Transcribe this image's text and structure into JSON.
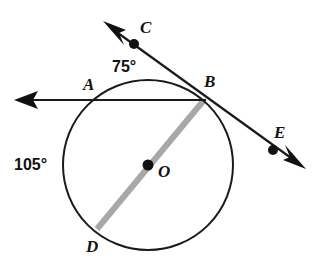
{
  "figure": {
    "type": "circle-geometry-diagram",
    "background_color": "#ffffff",
    "stroke_color": "#1a1a1a",
    "diameter_color": "#a8a8a8"
  },
  "circle": {
    "center_label": "O",
    "center_x": 148,
    "center_y": 165,
    "radius": 85
  },
  "points": [
    {
      "label": "A",
      "x": 93,
      "y": 100,
      "on_circle": true,
      "has_dot": false
    },
    {
      "label": "B",
      "x": 203,
      "y": 99,
      "on_circle": true,
      "has_dot": false
    },
    {
      "label": "C",
      "x": 134,
      "y": 44,
      "on_circle": false,
      "has_dot": true
    },
    {
      "label": "D",
      "x": 97,
      "y": 228,
      "on_circle": true,
      "has_dot": false
    },
    {
      "label": "E",
      "x": 273,
      "y": 150,
      "on_circle": false,
      "has_dot": true
    },
    {
      "label": "O",
      "x": 148,
      "y": 165,
      "on_circle": false,
      "has_dot": true
    }
  ],
  "labels": {
    "a": "A",
    "b": "B",
    "c": "C",
    "d": "D",
    "e": "E",
    "o": "O"
  },
  "angles": {
    "arc_top": "75°",
    "arc_left": "105°"
  },
  "lines": [
    {
      "name": "secant-ab",
      "description": "horizontal line through A and B with arrowhead pointing left",
      "color": "#1a1a1a",
      "arrow_start": true,
      "arrow_end": false
    },
    {
      "name": "secant-ce",
      "description": "line through C, B and E with arrowheads at both ends",
      "color": "#1a1a1a",
      "arrow_start": true,
      "arrow_end": true
    },
    {
      "name": "diameter-bd",
      "description": "gray diameter from B through O to D",
      "color": "#a8a8a8",
      "arrow_start": false,
      "arrow_end": false
    }
  ]
}
